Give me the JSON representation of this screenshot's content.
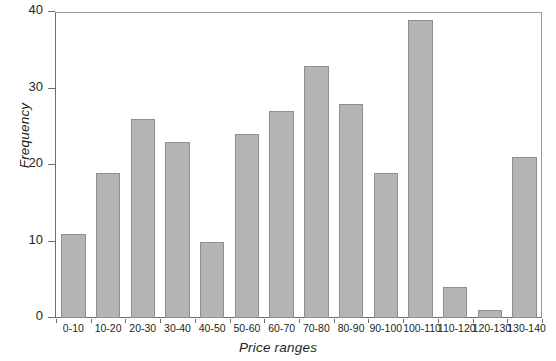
{
  "chart_data": {
    "type": "bar",
    "title": "",
    "xlabel": "Price ranges",
    "ylabel": "Frequency",
    "categories": [
      "0-10",
      "10-20",
      "20-30",
      "30-40",
      "40-50",
      "50-60",
      "60-70",
      "70-80",
      "80-90",
      "90-100",
      "100-110",
      "110-120",
      "120-130",
      "130-140"
    ],
    "values": [
      11,
      19,
      26,
      23,
      10,
      24,
      27,
      33,
      28,
      19,
      39,
      4,
      1,
      21
    ],
    "ylim": [
      0,
      40
    ],
    "ytick_values": [
      0,
      10,
      20,
      30,
      40
    ],
    "ytick_labels": [
      "0",
      "10",
      "20",
      "30",
      "40"
    ],
    "grid": false,
    "legend": "none",
    "bar_color": "#b4b4b4",
    "bar_edge_color": "#8e8e8e",
    "axis_color": "#6e6e6e",
    "frame_color": "#9a9a9a",
    "text_color": "#231f20"
  }
}
